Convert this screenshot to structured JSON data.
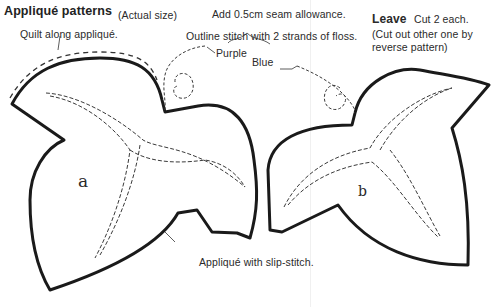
{
  "header": {
    "title": "Appliqué patterns",
    "subtitle": "(Actual size)",
    "seam_note": "Add 0.5cm seam allowance."
  },
  "leave_note": {
    "heading": "Leave",
    "cut": "Cut 2 each.",
    "line1": "(Cut out other one by",
    "line2": "reverse pattern)"
  },
  "annotations": {
    "quilt": "Quilt along appliqué.",
    "outline_stitch": "Outline stitch with 2 strands of floss.",
    "purple": "Purple",
    "blue": "Blue",
    "slip_stitch": "Appliqué with slip-stitch."
  },
  "pieces": {
    "a": "a",
    "b": "b"
  },
  "colors": {
    "outline": "#1a1a1a",
    "stitch": "#3a3a3a",
    "background": "#ffffff"
  }
}
